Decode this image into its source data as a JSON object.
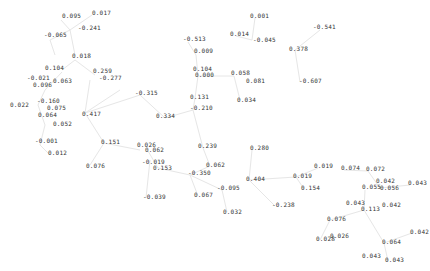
{
  "graph": {
    "edge_color": "#e6e6e6",
    "label_color": "#333333",
    "nodes": [
      {
        "label": "0.095",
        "x": 62,
        "y": 15
      },
      {
        "label": "0.017",
        "x": 92,
        "y": 12
      },
      {
        "label": "-0.241",
        "x": 78,
        "y": 27
      },
      {
        "label": "-0.065",
        "x": 44,
        "y": 34
      },
      {
        "label": "0.018",
        "x": 72,
        "y": 55
      },
      {
        "label": "0.104",
        "x": 45,
        "y": 67
      },
      {
        "label": "0.259",
        "x": 93,
        "y": 70
      },
      {
        "label": "-0.277",
        "x": 99,
        "y": 77
      },
      {
        "label": "-0.021",
        "x": 27,
        "y": 77
      },
      {
        "label": "0.063",
        "x": 53,
        "y": 80
      },
      {
        "label": "0.096",
        "x": 33,
        "y": 84
      },
      {
        "label": "-0.160",
        "x": 37,
        "y": 100
      },
      {
        "label": "0.022",
        "x": 10,
        "y": 104
      },
      {
        "label": "0.075",
        "x": 47,
        "y": 107
      },
      {
        "label": "0.064",
        "x": 38,
        "y": 114
      },
      {
        "label": "0.417",
        "x": 82,
        "y": 113
      },
      {
        "label": "0.052",
        "x": 53,
        "y": 123
      },
      {
        "label": "-0.001",
        "x": 35,
        "y": 140
      },
      {
        "label": "0.151",
        "x": 101,
        "y": 141
      },
      {
        "label": "0.012",
        "x": 48,
        "y": 152
      },
      {
        "label": "0.076",
        "x": 86,
        "y": 165
      },
      {
        "label": "-0.315",
        "x": 135,
        "y": 92
      },
      {
        "label": "0.334",
        "x": 156,
        "y": 115
      },
      {
        "label": "0.131",
        "x": 190,
        "y": 96
      },
      {
        "label": "-0.210",
        "x": 190,
        "y": 107
      },
      {
        "label": "-0.513",
        "x": 183,
        "y": 38
      },
      {
        "label": "0.009",
        "x": 194,
        "y": 50
      },
      {
        "label": "0.104",
        "x": 193,
        "y": 68
      },
      {
        "label": "0.000",
        "x": 195,
        "y": 74
      },
      {
        "label": "0.001",
        "x": 250,
        "y": 15
      },
      {
        "label": "0.014",
        "x": 230,
        "y": 33
      },
      {
        "label": "-0.045",
        "x": 253,
        "y": 39
      },
      {
        "label": "0.058",
        "x": 231,
        "y": 72
      },
      {
        "label": "0.081",
        "x": 246,
        "y": 80
      },
      {
        "label": "0.034",
        "x": 237,
        "y": 99
      },
      {
        "label": "-0.541",
        "x": 313,
        "y": 26
      },
      {
        "label": "0.378",
        "x": 289,
        "y": 48
      },
      {
        "label": "-0.607",
        "x": 299,
        "y": 80
      },
      {
        "label": "0.026",
        "x": 137,
        "y": 144
      },
      {
        "label": "0.062",
        "x": 145,
        "y": 149
      },
      {
        "label": "0.239",
        "x": 198,
        "y": 145
      },
      {
        "label": "-0.019",
        "x": 142,
        "y": 161
      },
      {
        "label": "0.153",
        "x": 153,
        "y": 167
      },
      {
        "label": "0.062",
        "x": 206,
        "y": 164
      },
      {
        "label": "-0.350",
        "x": 188,
        "y": 172
      },
      {
        "label": "-0.039",
        "x": 143,
        "y": 196
      },
      {
        "label": "0.067",
        "x": 194,
        "y": 194
      },
      {
        "label": "-0.095",
        "x": 217,
        "y": 187
      },
      {
        "label": "0.032",
        "x": 223,
        "y": 211
      },
      {
        "label": "0.280",
        "x": 250,
        "y": 147
      },
      {
        "label": "0.404",
        "x": 246,
        "y": 178
      },
      {
        "label": "-0.238",
        "x": 272,
        "y": 204
      },
      {
        "label": "0.019",
        "x": 293,
        "y": 175
      },
      {
        "label": "0.019",
        "x": 314,
        "y": 165
      },
      {
        "label": "0.154",
        "x": 301,
        "y": 187
      },
      {
        "label": "0.074",
        "x": 341,
        "y": 167
      },
      {
        "label": "0.072",
        "x": 366,
        "y": 168
      },
      {
        "label": "0.042",
        "x": 376,
        "y": 180
      },
      {
        "label": "0.055",
        "x": 362,
        "y": 186
      },
      {
        "label": "0.056",
        "x": 380,
        "y": 187
      },
      {
        "label": "0.043",
        "x": 408,
        "y": 182
      },
      {
        "label": "0.043",
        "x": 346,
        "y": 202
      },
      {
        "label": "0.113",
        "x": 361,
        "y": 208
      },
      {
        "label": "0.042",
        "x": 382,
        "y": 204
      },
      {
        "label": "0.076",
        "x": 327,
        "y": 218
      },
      {
        "label": "0.028",
        "x": 316,
        "y": 238
      },
      {
        "label": "0.026",
        "x": 330,
        "y": 235
      },
      {
        "label": "0.042",
        "x": 410,
        "y": 231
      },
      {
        "label": "0.064",
        "x": 382,
        "y": 241
      },
      {
        "label": "0.043",
        "x": 362,
        "y": 255
      },
      {
        "label": "0.043",
        "x": 385,
        "y": 259
      }
    ],
    "edges": [
      [
        61,
        20,
        70,
        30
      ],
      [
        70,
        30,
        92,
        15
      ],
      [
        70,
        30,
        50,
        40
      ],
      [
        50,
        40,
        55,
        55
      ],
      [
        70,
        30,
        75,
        55
      ],
      [
        75,
        60,
        62,
        70
      ],
      [
        75,
        60,
        95,
        75
      ],
      [
        62,
        72,
        45,
        90
      ],
      [
        45,
        90,
        38,
        105
      ],
      [
        38,
        105,
        45,
        125
      ],
      [
        45,
        125,
        40,
        145
      ],
      [
        40,
        145,
        50,
        155
      ],
      [
        90,
        80,
        85,
        113
      ],
      [
        85,
        113,
        104,
        143
      ],
      [
        104,
        143,
        90,
        165
      ],
      [
        85,
        113,
        140,
        95
      ],
      [
        140,
        95,
        165,
        118
      ],
      [
        165,
        118,
        193,
        110
      ],
      [
        193,
        110,
        195,
        98
      ],
      [
        193,
        110,
        203,
        148
      ],
      [
        195,
        98,
        198,
        76
      ],
      [
        198,
        76,
        196,
        55
      ],
      [
        196,
        55,
        188,
        42
      ],
      [
        198,
        76,
        234,
        76
      ],
      [
        234,
        76,
        240,
        100
      ],
      [
        255,
        18,
        252,
        40
      ],
      [
        252,
        40,
        236,
        36
      ],
      [
        320,
        30,
        295,
        50
      ],
      [
        295,
        50,
        300,
        82
      ],
      [
        148,
        151,
        158,
        168
      ],
      [
        158,
        168,
        190,
        175
      ],
      [
        190,
        175,
        210,
        166
      ],
      [
        190,
        175,
        198,
        196
      ],
      [
        190,
        175,
        222,
        190
      ],
      [
        222,
        190,
        227,
        212
      ],
      [
        203,
        148,
        210,
        166
      ],
      [
        252,
        150,
        249,
        180
      ],
      [
        249,
        180,
        275,
        206
      ],
      [
        249,
        180,
        296,
        177
      ],
      [
        296,
        177,
        304,
        189
      ],
      [
        296,
        177,
        318,
        168
      ],
      [
        344,
        170,
        368,
        171
      ],
      [
        368,
        171,
        380,
        188
      ],
      [
        380,
        188,
        410,
        185
      ],
      [
        365,
        190,
        364,
        210
      ],
      [
        364,
        210,
        330,
        220
      ],
      [
        330,
        220,
        320,
        240
      ],
      [
        364,
        210,
        384,
        243
      ],
      [
        384,
        243,
        412,
        233
      ],
      [
        384,
        243,
        388,
        261
      ],
      [
        150,
        160,
        146,
        198
      ],
      [
        120,
        90,
        85,
        113
      ],
      [
        104,
        143,
        140,
        150
      ]
    ]
  }
}
